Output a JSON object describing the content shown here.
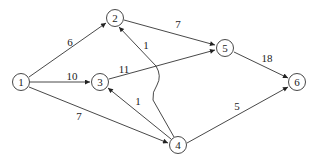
{
  "diagram": {
    "type": "directed-weighted-graph",
    "nodes": [
      {
        "id": "1",
        "label": "1",
        "x": 21,
        "y": 82
      },
      {
        "id": "2",
        "label": "2",
        "x": 115,
        "y": 18
      },
      {
        "id": "3",
        "label": "3",
        "x": 100,
        "y": 82
      },
      {
        "id": "4",
        "label": "4",
        "x": 178,
        "y": 145
      },
      {
        "id": "5",
        "label": "5",
        "x": 225,
        "y": 48
      },
      {
        "id": "6",
        "label": "6",
        "x": 297,
        "y": 82
      }
    ],
    "edges": [
      {
        "from": "1",
        "to": "2",
        "weight": "6"
      },
      {
        "from": "1",
        "to": "3",
        "weight": "10"
      },
      {
        "from": "1",
        "to": "4",
        "weight": "7"
      },
      {
        "from": "2",
        "to": "5",
        "weight": "7"
      },
      {
        "from": "3",
        "to": "5",
        "weight": "11"
      },
      {
        "from": "4",
        "to": "2",
        "weight": "1"
      },
      {
        "from": "4",
        "to": "3",
        "weight": "1"
      },
      {
        "from": "4",
        "to": "6",
        "weight": "5"
      },
      {
        "from": "5",
        "to": "6",
        "weight": "18"
      }
    ],
    "labels": {
      "n1": "1",
      "n2": "2",
      "n3": "3",
      "n4": "4",
      "n5": "5",
      "n6": "6",
      "e12": "6",
      "e13": "10",
      "e14": "7",
      "e25": "7",
      "e35": "11",
      "e42": "1",
      "e43": "1",
      "e46": "5",
      "e56": "18"
    }
  }
}
